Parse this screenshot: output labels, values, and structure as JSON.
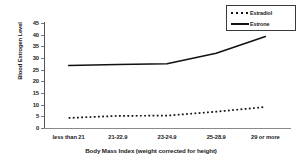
{
  "chart_data": {
    "type": "line",
    "title": "",
    "xlabel": "Body Mass Index (weight corrected for height)",
    "ylabel": "Blood Estrogen Level",
    "categories": [
      "less than 21",
      "21-22.9",
      "23-24.9",
      "25-28.9",
      "29 or more"
    ],
    "series": [
      {
        "name": "Estradiol",
        "style": "dotted",
        "color": "#111111",
        "values": [
          4.3,
          5.2,
          5.3,
          7.0,
          9.0
        ]
      },
      {
        "name": "Estrone",
        "style": "solid",
        "color": "#111111",
        "values": [
          26.8,
          27.2,
          27.5,
          32.0,
          39.2
        ]
      }
    ],
    "ylim": [
      0,
      45
    ],
    "yticks": [
      0,
      5,
      10,
      15,
      20,
      25,
      30,
      35,
      40,
      45
    ],
    "ytick_labels": [
      "0",
      "5",
      "10",
      "15",
      "20",
      "25",
      "30",
      "35",
      "40",
      "45"
    ],
    "grid": false,
    "legend_position": "top-right",
    "background_color": "#ffffff",
    "axis_color": "#555555"
  },
  "legend": {
    "entries": [
      {
        "label": "Estradiol",
        "marker": "dotted-line-swatch"
      },
      {
        "label": "Estrone",
        "marker": "solid-line-swatch"
      }
    ]
  }
}
